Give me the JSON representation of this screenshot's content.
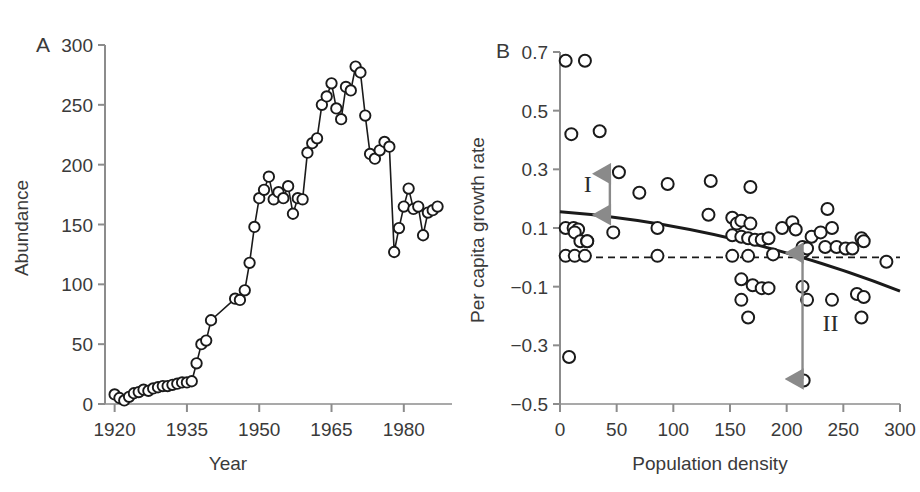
{
  "figure": {
    "background": "#ffffff",
    "axis_color": "#8c8c8c",
    "data_color": "#1a1a1a",
    "annotation_color": "#8a8a8a"
  },
  "panel_a": {
    "letter": "A",
    "xlabel": "Year",
    "ylabel": "Abundance",
    "xticks": [
      "1920",
      "1935",
      "1950",
      "1965",
      "1980"
    ],
    "yticks": [
      "0",
      "50",
      "100",
      "150",
      "200",
      "250",
      "300"
    ]
  },
  "panel_b": {
    "letter": "B",
    "xlabel": "Population density",
    "ylabel": "Per capita growth rate",
    "xticks": [
      "0",
      "50",
      "100",
      "150",
      "200",
      "250",
      "300"
    ],
    "yticks": [
      "0.7",
      "0.5",
      "0.3",
      "0.1",
      "−0.1",
      "−0.3",
      "−0.5"
    ],
    "annotations": [
      {
        "label": "I",
        "x": 44,
        "y_top": 0.285,
        "y_bottom": 0.145
      },
      {
        "label": "II",
        "x": 214,
        "y_top": 0.015,
        "y_bottom": -0.415
      }
    ]
  },
  "chart_data": [
    {
      "type": "line",
      "panel": "A",
      "title": "",
      "xlabel": "Year",
      "ylabel": "Abundance",
      "xlim": [
        1918,
        1990
      ],
      "ylim": [
        0,
        300
      ],
      "xticks": [
        1920,
        1935,
        1950,
        1965,
        1980
      ],
      "yticks": [
        0,
        50,
        100,
        150,
        200,
        250,
        300
      ],
      "grid": false,
      "legend": "none",
      "marker": "open-circle",
      "x": [
        1920,
        1921,
        1922,
        1923,
        1924,
        1925,
        1926,
        1927,
        1928,
        1929,
        1930,
        1931,
        1932,
        1933,
        1934,
        1935,
        1936,
        1937,
        1938,
        1939,
        1940,
        1945,
        1946,
        1947,
        1948,
        1949,
        1950,
        1951,
        1952,
        1953,
        1954,
        1955,
        1956,
        1957,
        1958,
        1959,
        1960,
        1961,
        1962,
        1963,
        1964,
        1965,
        1966,
        1967,
        1968,
        1969,
        1970,
        1971,
        1972,
        1973,
        1974,
        1975,
        1976,
        1977,
        1978,
        1979,
        1980,
        1981,
        1982,
        1983,
        1984,
        1985,
        1986,
        1987
      ],
      "y": [
        8,
        5,
        3,
        6,
        9,
        10,
        12,
        11,
        13,
        14,
        15,
        15,
        16,
        17,
        18,
        18,
        19,
        34,
        50,
        53,
        70,
        88,
        87,
        95,
        118,
        148,
        172,
        179,
        190,
        171,
        177,
        172,
        182,
        159,
        172,
        171,
        210,
        218,
        222,
        250,
        257,
        268,
        247,
        238,
        265,
        262,
        282,
        277,
        241,
        209,
        205,
        212,
        219,
        215,
        127,
        147,
        165,
        180,
        163,
        165,
        141,
        160,
        162,
        165,
        131,
        155,
        152,
        165,
        172,
        180,
        196,
        205,
        211,
        215,
        214,
        200,
        228,
        270,
        216
      ]
    },
    {
      "type": "scatter",
      "panel": "B",
      "title": "",
      "xlabel": "Population density",
      "ylabel": "Per capita growth rate",
      "xlim": [
        0,
        300
      ],
      "ylim": [
        -0.5,
        0.7
      ],
      "xticks": [
        0,
        50,
        100,
        150,
        200,
        250,
        300
      ],
      "yticks": [
        -0.5,
        -0.3,
        -0.1,
        0.1,
        0.3,
        0.5,
        0.7
      ],
      "grid": false,
      "legend": "none",
      "marker": "open-circle",
      "points": [
        [
          5,
          0.67
        ],
        [
          22,
          0.67
        ],
        [
          10,
          0.42
        ],
        [
          35,
          0.43
        ],
        [
          52,
          0.29
        ],
        [
          70,
          0.22
        ],
        [
          95,
          0.25
        ],
        [
          133,
          0.26
        ],
        [
          168,
          0.24
        ],
        [
          5,
          0.1
        ],
        [
          12,
          0.1
        ],
        [
          16,
          0.095
        ],
        [
          13,
          0.085
        ],
        [
          18,
          0.055
        ],
        [
          24,
          0.055
        ],
        [
          5,
          0.005
        ],
        [
          13,
          0.005
        ],
        [
          22,
          0.005
        ],
        [
          24,
          0.055
        ],
        [
          47,
          0.085
        ],
        [
          86,
          0.1
        ],
        [
          86,
          0.005
        ],
        [
          131,
          0.145
        ],
        [
          152,
          0.135
        ],
        [
          156,
          0.115
        ],
        [
          160,
          0.125
        ],
        [
          152,
          0.075
        ],
        [
          160,
          0.07
        ],
        [
          166,
          0.065
        ],
        [
          172,
          0.06
        ],
        [
          178,
          0.06
        ],
        [
          184,
          0.065
        ],
        [
          168,
          0.115
        ],
        [
          152,
          0.005
        ],
        [
          166,
          0.005
        ],
        [
          188,
          0.01
        ],
        [
          196,
          0.1
        ],
        [
          205,
          0.12
        ],
        [
          208,
          0.095
        ],
        [
          214,
          0.035
        ],
        [
          215,
          0.02
        ],
        [
          218,
          0.03
        ],
        [
          222,
          0.07
        ],
        [
          230,
          0.085
        ],
        [
          236,
          0.165
        ],
        [
          240,
          0.1
        ],
        [
          234,
          0.035
        ],
        [
          244,
          0.035
        ],
        [
          252,
          0.03
        ],
        [
          258,
          0.03
        ],
        [
          266,
          0.065
        ],
        [
          268,
          0.055
        ],
        [
          288,
          -0.015
        ],
        [
          160,
          -0.075
        ],
        [
          170,
          -0.095
        ],
        [
          178,
          -0.105
        ],
        [
          184,
          -0.105
        ],
        [
          160,
          -0.145
        ],
        [
          166,
          -0.205
        ],
        [
          214,
          -0.1
        ],
        [
          218,
          -0.145
        ],
        [
          240,
          -0.145
        ],
        [
          262,
          -0.125
        ],
        [
          268,
          -0.135
        ],
        [
          266,
          -0.205
        ],
        [
          215,
          -0.42
        ],
        [
          8,
          -0.34
        ]
      ],
      "fit_curve": {
        "type": "quadratic-fit",
        "y_at_x0": 0.155,
        "y_at_x150": 0.065,
        "y_at_x300": -0.115
      },
      "zero_line": {
        "type": "dashed-horizontal",
        "y": 0.0
      }
    }
  ]
}
